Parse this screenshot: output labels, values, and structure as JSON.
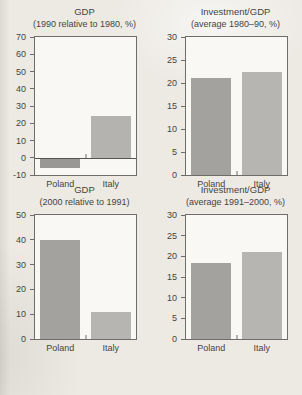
{
  "page": {
    "background": "#edeae4",
    "text_color": "#454440",
    "frame_color": "#6e6d69",
    "plot_background": "#f9f8f4"
  },
  "chart_data": [
    {
      "type": "bar",
      "title": "GDP",
      "subtitle": "(1990 relative to 1980, %)",
      "categories": [
        "Poland",
        "Italy"
      ],
      "values": [
        -6,
        24
      ],
      "ylim": [
        -10,
        70
      ],
      "yticks": [
        70,
        60,
        50,
        40,
        30,
        20,
        10,
        0,
        -10
      ],
      "bar_colors": [
        "#999894",
        "#b5b3af"
      ],
      "grid": false,
      "legend": false
    },
    {
      "type": "bar",
      "title": "Investment/GDP",
      "subtitle": "(average 1980–90, %)",
      "categories": [
        "Poland",
        "Italy"
      ],
      "values": [
        21,
        22.5
      ],
      "ylim": [
        0,
        30
      ],
      "yticks": [
        30,
        25,
        20,
        15,
        10,
        5,
        0
      ],
      "bar_colors": [
        "#a3a29e",
        "#b6b5b1"
      ],
      "grid": false,
      "legend": false
    },
    {
      "type": "bar",
      "title": "GDP",
      "subtitle": "(2000 relative to 1991)",
      "categories": [
        "Poland",
        "Italy"
      ],
      "values": [
        40,
        11
      ],
      "ylim": [
        0,
        50
      ],
      "yticks": [
        50,
        40,
        30,
        20,
        10,
        0
      ],
      "bar_colors": [
        "#a3a29e",
        "#b6b5b1"
      ],
      "grid": false,
      "legend": false
    },
    {
      "type": "bar",
      "title": "Investment/GDP",
      "subtitle": "(average 1991–2000, %)",
      "categories": [
        "Poland",
        "Italy"
      ],
      "values": [
        18.5,
        21
      ],
      "ylim": [
        0,
        30
      ],
      "yticks": [
        30,
        25,
        20,
        15,
        10,
        5,
        0
      ],
      "bar_colors": [
        "#a3a29e",
        "#b6b5b1"
      ],
      "grid": false,
      "legend": false
    }
  ]
}
